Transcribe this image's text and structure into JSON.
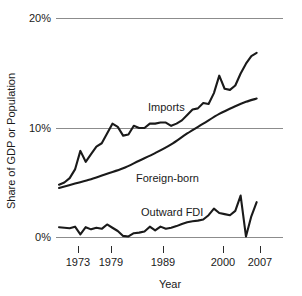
{
  "chart_data": {
    "type": "line",
    "title": "",
    "subtitle": "",
    "xlabel": "Year",
    "ylabel": "Share of GDP or Population",
    "xlim": [
      1970,
      2008
    ],
    "ylim": [
      0,
      20
    ],
    "grid": true,
    "gridlines_y": [
      0,
      10,
      20
    ],
    "legend_position": "inline-annotations",
    "y_tick_labels": [
      "20%",
      "10%",
      "0%"
    ],
    "y_tick_values": [
      20,
      10,
      0
    ],
    "x_tick_labels": [
      "1973",
      "1979",
      "1989",
      "2000",
      "2007"
    ],
    "x_tick_values": [
      1973,
      1979,
      1989,
      2000,
      2007
    ],
    "annotations": [
      {
        "text": "Imports",
        "x": 1987,
        "y": 12.3
      },
      {
        "text": "Foreign-born",
        "x": 1985,
        "y": 5.8
      },
      {
        "text": "Outward FDI",
        "x": 1985,
        "y": 2.6
      }
    ],
    "series": [
      {
        "name": "Imports",
        "x": [
          1970,
          1971,
          1972,
          1973,
          1974,
          1975,
          1976,
          1977,
          1978,
          1979,
          1980,
          1981,
          1982,
          1983,
          1984,
          1985,
          1986,
          1987,
          1988,
          1989,
          1990,
          1991,
          1992,
          1993,
          1994,
          1995,
          1996,
          1997,
          1998,
          1999,
          2000,
          2001,
          2002,
          2003,
          2004,
          2005,
          2006,
          2007
        ],
        "values": [
          4.8,
          5.0,
          5.4,
          6.2,
          7.9,
          6.9,
          7.6,
          8.3,
          8.6,
          9.5,
          10.4,
          10.1,
          9.3,
          9.4,
          10.2,
          10.0,
          10.0,
          10.4,
          10.4,
          10.5,
          10.5,
          10.2,
          10.4,
          10.7,
          11.2,
          11.7,
          11.8,
          12.3,
          12.2,
          13.2,
          14.8,
          13.6,
          13.5,
          13.9,
          15.0,
          15.9,
          16.6,
          16.9
        ]
      },
      {
        "name": "Foreign-born",
        "x": [
          1970,
          1973,
          1976,
          1979,
          1982,
          1985,
          1988,
          1991,
          1994,
          1997,
          2000,
          2003,
          2005,
          2007
        ],
        "values": [
          4.5,
          4.9,
          5.3,
          5.8,
          6.3,
          7.0,
          7.7,
          8.5,
          9.5,
          10.4,
          11.3,
          12.0,
          12.4,
          12.7
        ]
      },
      {
        "name": "Outward FDI",
        "x": [
          1970,
          1971,
          1972,
          1973,
          1974,
          1975,
          1976,
          1977,
          1978,
          1979,
          1980,
          1981,
          1982,
          1983,
          1984,
          1985,
          1986,
          1987,
          1988,
          1989,
          1990,
          1991,
          1992,
          1993,
          1994,
          1995,
          1996,
          1997,
          1998,
          1999,
          2000,
          2001,
          2002,
          2003,
          2004,
          2005,
          2006,
          2007
        ],
        "values": [
          0.9,
          0.85,
          0.8,
          0.95,
          0.25,
          0.9,
          0.7,
          0.85,
          0.75,
          1.15,
          0.85,
          0.55,
          0.1,
          0.05,
          0.35,
          0.4,
          0.5,
          0.95,
          0.6,
          0.95,
          0.75,
          0.85,
          1.0,
          1.2,
          1.35,
          1.45,
          1.5,
          1.6,
          2.0,
          2.6,
          2.2,
          2.1,
          2.0,
          2.4,
          3.8,
          0.05,
          1.9,
          3.2
        ]
      }
    ]
  }
}
